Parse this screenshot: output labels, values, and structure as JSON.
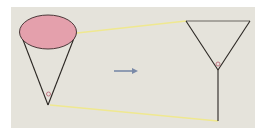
{
  "diagram": {
    "colors": {
      "background": "#e5e3db",
      "ellipse_fill": "#e4a0ac",
      "stroke": "#2a2622",
      "connector": "#f0ea96",
      "arrow": "#7a8aa8",
      "angle_marker": "#c47a86"
    },
    "left_figure": {
      "shape": "cone",
      "angle_marker": "small circle at apex"
    },
    "arrow": {
      "direction": "right"
    },
    "right_figure": {
      "shape": "triangle with stem (Y shape)",
      "angle_marker": "small circle at vertex"
    }
  }
}
